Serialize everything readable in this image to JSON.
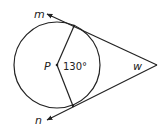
{
  "diagram": {
    "type": "circle with two tangent lines",
    "labels": {
      "center": "P",
      "central_angle": "130°",
      "exterior_angle": "w",
      "tangent_top": "m",
      "tangent_bottom": "n"
    },
    "colors": {
      "stroke": "#222222",
      "background": "#ffffff"
    }
  }
}
